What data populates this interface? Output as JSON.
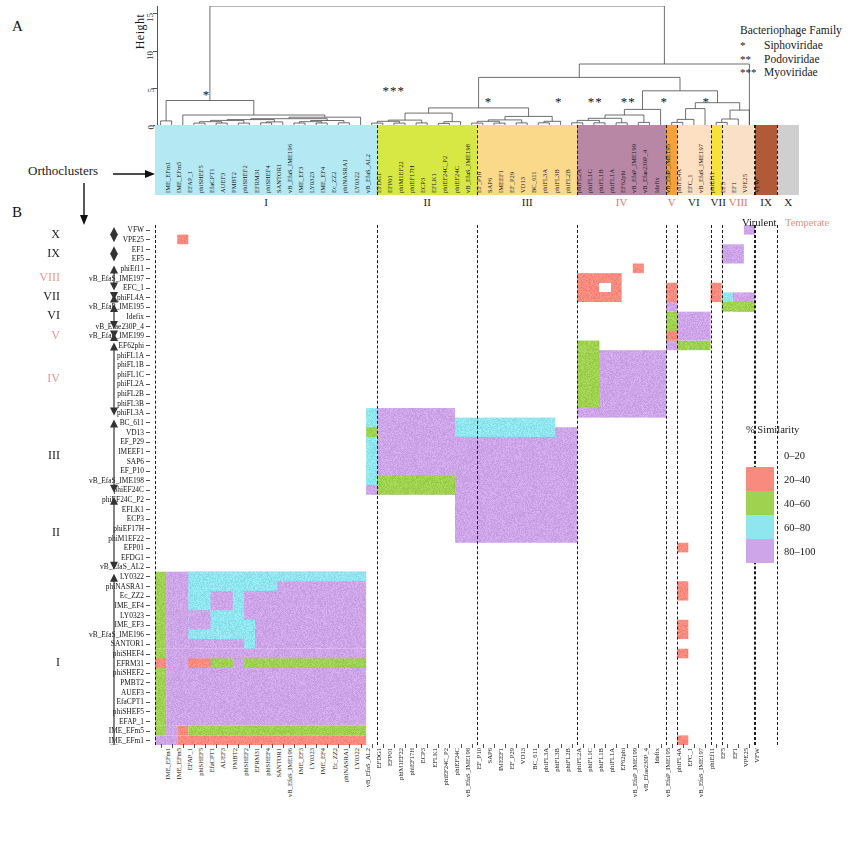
{
  "panels": {
    "a": "A",
    "b": "B"
  },
  "dendrogram": {
    "y_axis_title": "Height",
    "y_ticks": [
      "0",
      "5",
      "10",
      "15"
    ],
    "y_range": [
      0,
      16
    ],
    "star_marks": [
      {
        "label": "*",
        "x": 0.085
      },
      {
        "label": "***",
        "x": 0.395
      },
      {
        "label": "*",
        "x": 0.555
      },
      {
        "label": "*",
        "x": 0.672
      },
      {
        "label": "**",
        "x": 0.732
      },
      {
        "label": "**",
        "x": 0.787
      },
      {
        "label": "*",
        "x": 0.848
      },
      {
        "label": "*",
        "x": 0.918
      }
    ]
  },
  "orthoclusters_annotation": "Orthoclusters",
  "family_legend": {
    "title": "Bacteriophage Family",
    "items": [
      {
        "stars": "*",
        "name": "Siphoviridae"
      },
      {
        "stars": "**",
        "name": "Podoviridae"
      },
      {
        "stars": "***",
        "name": "Myoviridae"
      }
    ]
  },
  "lifestyle_legend": {
    "virulent": "Virulent",
    "temperate": "Temperate",
    "virulent_color": "#111111",
    "temperate_color": "#f08e85"
  },
  "similarity_legend": {
    "title": "% Similarity",
    "bins": [
      {
        "label": "0–20",
        "color": "none"
      },
      {
        "label": "20–40",
        "color": "#f98b7e"
      },
      {
        "label": "40–60",
        "color": "#9ed24f"
      },
      {
        "label": "60–80",
        "color": "#8fe6ef"
      },
      {
        "label": "80–100",
        "color": "#cfa5ea"
      }
    ]
  },
  "clusters": [
    {
      "roman": "I",
      "color": "#b4e8f2",
      "start": 0,
      "count": 20,
      "temperate": false
    },
    {
      "roman": "II",
      "color": "#d7e844",
      "start": 20,
      "count": 9,
      "temperate": false
    },
    {
      "roman": "III",
      "color": "#fbd98b",
      "start": 29,
      "count": 9,
      "temperate": false
    },
    {
      "roman": "IV",
      "color": "#b987a6",
      "start": 38,
      "count": 8,
      "temperate": true
    },
    {
      "roman": "V",
      "color": "#f5a03a",
      "start": 46,
      "count": 1,
      "temperate": true
    },
    {
      "roman": "VI",
      "color": "#fde0c2",
      "start": 47,
      "count": 3,
      "temperate": false
    },
    {
      "roman": "VII",
      "color": "#f7e23a",
      "start": 50,
      "count": 1,
      "temperate": false
    },
    {
      "roman": "VIII",
      "color": "#fbe0c8",
      "start": 51,
      "count": 3,
      "temperate": true
    },
    {
      "roman": "IX",
      "color": "#b05a37",
      "start": 54,
      "count": 2,
      "temperate": false
    },
    {
      "roman": "X",
      "color": "#cfcfcf",
      "start": 56,
      "count": 2,
      "temperate": false
    }
  ],
  "left_cluster_axis": [
    {
      "roman": "X",
      "temperate": false
    },
    {
      "roman": "IX",
      "temperate": false
    },
    {
      "roman": "VIII",
      "temperate": true
    },
    {
      "roman": "VII",
      "temperate": false
    },
    {
      "roman": "VI",
      "temperate": false
    },
    {
      "roman": "V",
      "temperate": true
    },
    {
      "roman": "IV",
      "temperate": true
    },
    {
      "roman": "III",
      "temperate": false
    },
    {
      "roman": "II",
      "temperate": false
    },
    {
      "roman": "I",
      "temperate": false
    }
  ],
  "chart_data": {
    "type": "heatmap",
    "xlabel": "",
    "ylabel": "",
    "grid": false,
    "legend_position": "right",
    "color_bins": [
      {
        "range": [
          0,
          20
        ],
        "color": "none"
      },
      {
        "range": [
          20,
          40
        ],
        "color": "#f98b7e"
      },
      {
        "range": [
          40,
          60
        ],
        "color": "#9ed24f"
      },
      {
        "range": [
          60,
          80
        ],
        "color": "#8fe6ef"
      },
      {
        "range": [
          80,
          100
        ],
        "color": "#cfa5ea"
      }
    ],
    "columns": [
      "IME_EFm1",
      "IME_EFm5",
      "EFAP_1",
      "phiSHEF5",
      "EfaCPT1",
      "AUEF3",
      "PMBT2",
      "phiSHEF2",
      "EFRM31",
      "phiSHEF4",
      "SANTOR1",
      "vB_EfaS_IME196",
      "IME_EF3",
      "LY0323",
      "IME_EF4",
      "Ec_ZZ2",
      "phiNASRA1",
      "LY0322",
      "vB_EfaS_AL2",
      "EFDG1",
      "EFP01",
      "phiM1EF22",
      "phiEF17H",
      "ECP3",
      "EFLK1",
      "phiEF24C_P2",
      "phiEF24C",
      "vB_EfaS_IME198",
      "EF_P10",
      "SAP6",
      "IMEEF1",
      "EF_P29",
      "VD13",
      "BC_611",
      "phiFL3A",
      "phiFL3B",
      "phiFL2B",
      "phiFL2A",
      "phiFL1C",
      "phiFL1B",
      "phiFL1A",
      "EF62phi",
      "vB_EfaP_IME199",
      "vB_Efae230P_4",
      "Idefix",
      "vB_EfaP_IME195",
      "phiFL4A",
      "EFC_1",
      "vB_EfaS_IME197",
      "phiEf11",
      "EF5",
      "EF1",
      "VPE25",
      "VFW"
    ],
    "rows": [
      "VFW",
      "VPE25",
      "EF1",
      "EF5",
      "phiEf11",
      "vB_EfaS_IME197",
      "EFC_1",
      "phiFL4A",
      "vB_EfaP_IME195",
      "Idefix",
      "vB_Efae230P_4",
      "vB_EfaP_IME199",
      "EF62phi",
      "phiFL1A",
      "phiFL1B",
      "phiFL1C",
      "phiFL2A",
      "phiFL2B",
      "phiFL3B",
      "phiFL3A",
      "BC_611",
      "VD13",
      "EF_P29",
      "IMEEF1",
      "SAP6",
      "EF_P10",
      "vB_EfaS_IME198",
      "phiEF24C",
      "phiEF24C_P2",
      "EFLK1",
      "ECP3",
      "phiEF17H",
      "phiM1EF22",
      "EFP01",
      "EFDG1",
      "vB_EfaS_AL2",
      "LY0322",
      "phiNASRA1",
      "Ec_ZZ2",
      "IME_EF4",
      "LY0323",
      "IME_EF3",
      "vB_EfaS_IME196",
      "SANTOR1",
      "phiSHEF4",
      "EFRM31",
      "phiSHEF2",
      "PMBT2",
      "AUEF3",
      "EfaCPT1",
      "phiSHEF5",
      "EFAP_1",
      "IME_EFm5",
      "IME_EFm1"
    ],
    "blocks": [
      {
        "r0": 54,
        "r1": 55,
        "c0": 0,
        "c1": 2,
        "v": 90
      },
      {
        "r0": 54,
        "r1": 55,
        "c0": 2,
        "c1": 3,
        "v": 30
      },
      {
        "r0": 54,
        "r1": 55,
        "c0": 3,
        "c1": 10,
        "v": 30
      },
      {
        "r0": 54,
        "r1": 55,
        "c0": 10,
        "c1": 12,
        "v": 30
      },
      {
        "r0": 54,
        "r1": 55,
        "c0": 12,
        "c1": 18,
        "v": 30
      },
      {
        "r0": 54,
        "r1": 55,
        "c0": 18,
        "c1": 19,
        "v": 50
      },
      {
        "r0": 53,
        "r1": 54,
        "c0": 0,
        "c1": 2,
        "v": 90
      },
      {
        "r0": 53,
        "r1": 54,
        "c0": 2,
        "c1": 19,
        "v": 30
      },
      {
        "r0": 52,
        "r1": 53,
        "c0": 0,
        "c1": 1,
        "v": 50
      },
      {
        "r0": 52,
        "r1": 53,
        "c0": 1,
        "c1": 2,
        "v": 90
      },
      {
        "r0": 52,
        "r1": 53,
        "c0": 2,
        "c1": 3,
        "v": 30
      },
      {
        "r0": 52,
        "r1": 53,
        "c0": 3,
        "c1": 19,
        "v": 50
      },
      {
        "r0": 44,
        "r1": 52,
        "c0": 0,
        "c1": 1,
        "v": 50
      },
      {
        "r0": 44,
        "r1": 52,
        "c0": 1,
        "c1": 19,
        "v": 90
      },
      {
        "r0": 45,
        "r1": 46,
        "c0": 0,
        "c1": 1,
        "v": 30
      },
      {
        "r0": 45,
        "r1": 46,
        "c0": 3,
        "c1": 5,
        "v": 30
      },
      {
        "r0": 45,
        "r1": 46,
        "c0": 5,
        "c1": 7,
        "v": 50
      },
      {
        "r0": 45,
        "r1": 46,
        "c0": 8,
        "c1": 19,
        "v": 50
      },
      {
        "r0": 36,
        "r1": 44,
        "c0": 0,
        "c1": 1,
        "v": 50
      },
      {
        "r0": 36,
        "r1": 44,
        "c0": 1,
        "c1": 19,
        "v": 90
      },
      {
        "r0": 36,
        "r1": 43,
        "c0": 3,
        "c1": 8,
        "v": 70
      },
      {
        "r0": 36,
        "r1": 38,
        "c0": 8,
        "c1": 11,
        "v": 70
      },
      {
        "r0": 36,
        "r1": 37,
        "c0": 11,
        "c1": 19,
        "v": 70
      },
      {
        "r0": 38,
        "r1": 40,
        "c0": 5,
        "c1": 7,
        "v": 90
      },
      {
        "r0": 40,
        "r1": 42,
        "c0": 3,
        "c1": 5,
        "v": 90
      },
      {
        "r0": 41,
        "r1": 43,
        "c0": 8,
        "c1": 9,
        "v": 70
      },
      {
        "r0": 43,
        "r1": 44,
        "c0": 8,
        "c1": 9,
        "v": 70
      },
      {
        "r0": 19,
        "r1": 28,
        "c0": 20,
        "c1": 27,
        "v": 90
      },
      {
        "r0": 19,
        "r1": 28,
        "c0": 19,
        "c1": 20,
        "v": 70
      },
      {
        "r0": 21,
        "r1": 22,
        "c0": 19,
        "c1": 20,
        "v": 50
      },
      {
        "r0": 26,
        "r1": 28,
        "c0": 20,
        "c1": 27,
        "v": 50
      },
      {
        "r0": 27,
        "r1": 28,
        "c0": 19,
        "c1": 20,
        "v": 90
      },
      {
        "r0": 21,
        "r1": 33,
        "c0": 27,
        "c1": 38,
        "v": 90
      },
      {
        "r0": 20,
        "r1": 22,
        "c0": 27,
        "c1": 36,
        "v": 70
      },
      {
        "r0": 13,
        "r1": 20,
        "c0": 38,
        "c1": 46,
        "v": 90
      },
      {
        "r0": 13,
        "r1": 19,
        "c0": 38,
        "c1": 40,
        "v": 50
      },
      {
        "r0": 12,
        "r1": 13,
        "c0": 38,
        "c1": 40,
        "v": 50
      },
      {
        "r0": 12,
        "r1": 13,
        "c0": 46,
        "c1": 47,
        "v": 90
      },
      {
        "r0": 12,
        "r1": 13,
        "c0": 47,
        "c1": 50,
        "v": 50
      },
      {
        "r0": 9,
        "r1": 12,
        "c0": 46,
        "c1": 47,
        "v": 50
      },
      {
        "r0": 9,
        "r1": 12,
        "c0": 47,
        "c1": 50,
        "v": 90
      },
      {
        "r0": 11,
        "r1": 12,
        "c0": 46,
        "c1": 47,
        "v": 30
      },
      {
        "r0": 8,
        "r1": 9,
        "c0": 46,
        "c1": 47,
        "v": 90
      },
      {
        "r0": 5,
        "r1": 8,
        "c0": 38,
        "c1": 42,
        "v": 30
      },
      {
        "r0": 6,
        "r1": 7,
        "c0": 40,
        "c1": 41,
        "v": 0
      },
      {
        "r0": 6,
        "r1": 8,
        "c0": 46,
        "c1": 47,
        "v": 30
      },
      {
        "r0": 4,
        "r1": 5,
        "c0": 43,
        "c1": 44,
        "v": 30
      },
      {
        "r0": 6,
        "r1": 8,
        "c0": 50,
        "c1": 51,
        "v": 30
      },
      {
        "r0": 7,
        "r1": 8,
        "c0": 51,
        "c1": 52,
        "v": 70
      },
      {
        "r0": 7,
        "r1": 9,
        "c0": 52,
        "c1": 54,
        "v": 90
      },
      {
        "r0": 8,
        "r1": 9,
        "c0": 51,
        "c1": 54,
        "v": 50
      },
      {
        "r0": 2,
        "r1": 4,
        "c0": 51,
        "c1": 53,
        "v": 90
      },
      {
        "r0": 0,
        "r1": 1,
        "c0": 53,
        "c1": 54,
        "v": 90
      },
      {
        "r0": 1,
        "r1": 2,
        "c0": 2,
        "c1": 3,
        "v": 30
      },
      {
        "r0": 33,
        "r1": 34,
        "c0": 47,
        "c1": 48,
        "v": 30
      },
      {
        "r0": 37,
        "r1": 39,
        "c0": 47,
        "c1": 48,
        "v": 30
      },
      {
        "r0": 41,
        "r1": 43,
        "c0": 47,
        "c1": 48,
        "v": 30
      },
      {
        "r0": 44,
        "r1": 45,
        "c0": 47,
        "c1": 48,
        "v": 30
      },
      {
        "r0": 53,
        "r1": 54,
        "c0": 47,
        "c1": 48,
        "v": 30
      }
    ]
  }
}
